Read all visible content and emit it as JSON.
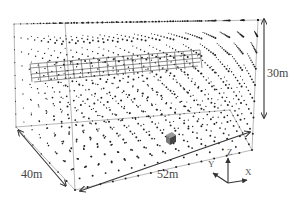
{
  "figure": {
    "type": "3d-wireframe-point-grid",
    "dimensions": {
      "height_label": "30m",
      "depth_label": "40m",
      "width_label": "52m"
    },
    "axes": {
      "x_label": "X",
      "y_label": "Y",
      "z_label": "Z"
    },
    "elements": {
      "point_grid": "regular 3D grid of sensor/sample points",
      "mesh_structure": "elongated lattice structure near top",
      "cube": "small solid cube near floor"
    },
    "colors": {
      "background": "#ffffff",
      "lines": "#555555",
      "points": "#222222",
      "arrows": "#333333",
      "cube": "#555555"
    }
  }
}
